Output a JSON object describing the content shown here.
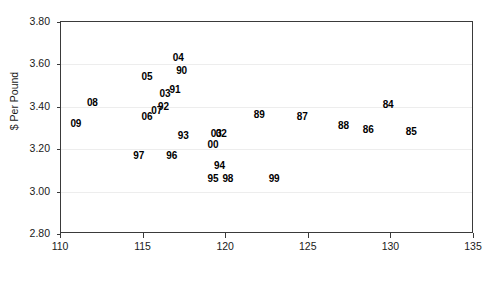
{
  "chart_data": {
    "type": "scatter",
    "title": "",
    "xlabel": "",
    "ylabel": "$ Per Pound",
    "xlim": [
      110,
      135
    ],
    "ylim": [
      2.8,
      3.8
    ],
    "xticks": [
      "110",
      "115",
      "120",
      "125",
      "130",
      "135"
    ],
    "yticks": [
      "2.80",
      "3.00",
      "3.20",
      "3.40",
      "3.60",
      "3.80"
    ],
    "grid": "horizontal",
    "legend": "none",
    "point_label_style": "year-two-digit",
    "points": [
      {
        "label": "09",
        "x": 110.9,
        "y": 3.32
      },
      {
        "label": "08",
        "x": 111.9,
        "y": 3.42
      },
      {
        "label": "97",
        "x": 114.7,
        "y": 3.17
      },
      {
        "label": "06",
        "x": 115.2,
        "y": 3.35
      },
      {
        "label": "05",
        "x": 115.2,
        "y": 3.54
      },
      {
        "label": "07",
        "x": 115.8,
        "y": 3.38
      },
      {
        "label": "92",
        "x": 116.2,
        "y": 3.4
      },
      {
        "label": "03",
        "x": 116.3,
        "y": 3.46
      },
      {
        "label": "96",
        "x": 116.7,
        "y": 3.17
      },
      {
        "label": "91",
        "x": 116.9,
        "y": 3.48
      },
      {
        "label": "04",
        "x": 117.1,
        "y": 3.63
      },
      {
        "label": "90",
        "x": 117.3,
        "y": 3.57
      },
      {
        "label": "93",
        "x": 117.4,
        "y": 3.26
      },
      {
        "label": "95",
        "x": 119.2,
        "y": 3.06
      },
      {
        "label": "00",
        "x": 119.2,
        "y": 3.22
      },
      {
        "label": "03",
        "x": 119.4,
        "y": 3.27
      },
      {
        "label": "02",
        "x": 119.7,
        "y": 3.27
      },
      {
        "label": "94",
        "x": 119.6,
        "y": 3.12
      },
      {
        "label": "98",
        "x": 120.1,
        "y": 3.06
      },
      {
        "label": "89",
        "x": 122.0,
        "y": 3.36
      },
      {
        "label": "99",
        "x": 122.9,
        "y": 3.06
      },
      {
        "label": "87",
        "x": 124.6,
        "y": 3.35
      },
      {
        "label": "88",
        "x": 127.1,
        "y": 3.31
      },
      {
        "label": "86",
        "x": 128.6,
        "y": 3.29
      },
      {
        "label": "84",
        "x": 129.8,
        "y": 3.41
      },
      {
        "label": "85",
        "x": 131.2,
        "y": 3.28
      }
    ]
  }
}
